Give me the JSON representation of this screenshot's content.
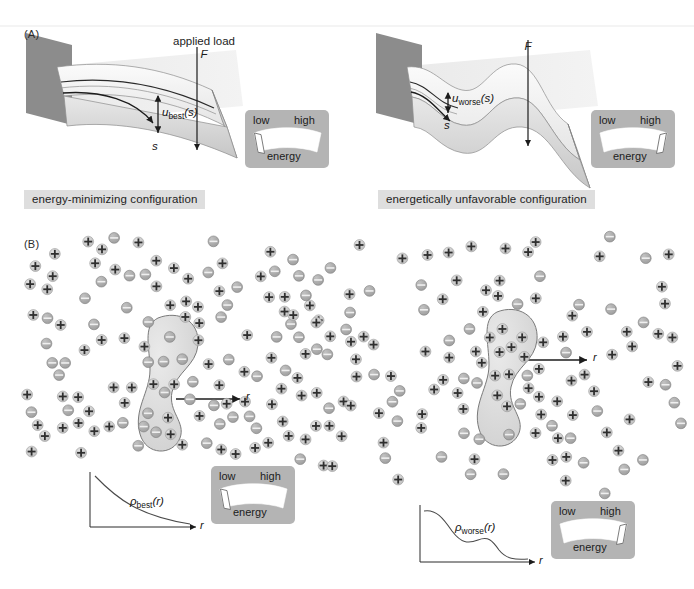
{
  "figure": {
    "width": 694,
    "height": 589,
    "background": "#ffffff"
  },
  "panels": {
    "a": {
      "letter": "(A)",
      "left": {
        "caption": "energy-minimizing configuration",
        "load_label_line1": "applied load",
        "load_label_line2": "F",
        "displacement_symbol": "u",
        "displacement_subscript": "best",
        "displacement_argument": "(s)",
        "arclength_label": "s",
        "gauge": {
          "low_label": "low",
          "high_label": "high",
          "unit_label": "energy",
          "needle_position": "low"
        }
      },
      "right": {
        "caption": "energetically unfavorable configuration",
        "load_label_line2": "F",
        "displacement_symbol": "u",
        "displacement_subscript": "worse",
        "displacement_argument": "(s)",
        "arclength_label": "s",
        "gauge": {
          "low_label": "low",
          "high_label": "high",
          "unit_label": "energy",
          "needle_position": "high"
        }
      }
    },
    "b": {
      "letter": "(B)",
      "left": {
        "radial_axis_label": "r",
        "plot": {
          "curve_symbol": "ρ",
          "curve_subscript": "best",
          "curve_argument": "(r)",
          "x_axis_label": "r"
        },
        "gauge": {
          "low_label": "low",
          "high_label": "high",
          "unit_label": "energy",
          "needle_position": "low"
        }
      },
      "right": {
        "radial_axis_label": "r",
        "plot": {
          "curve_symbol": "ρ",
          "curve_subscript": "worse",
          "curve_argument": "(r)",
          "x_axis_label": "r"
        },
        "gauge": {
          "low_label": "low",
          "high_label": "high",
          "unit_label": "energy",
          "needle_position": "high"
        }
      }
    }
  },
  "colors": {
    "wall_gray": "#8c8c8c",
    "beam_top": "#f2f2f2",
    "beam_side": "#d9d9d9",
    "plane_gray": "#e6e6e6",
    "caption_bg": "#dedede",
    "gauge_bg": "#b4b4b4",
    "gauge_band": "#ffffff",
    "ion_positive_fill": "#c9c9c9",
    "ion_negative_fill": "#a8a8a8",
    "stroke": "#3a3a3a"
  },
  "chart_data": [
    {
      "type": "line",
      "title": "ρ_best(r)",
      "xlabel": "r",
      "ylabel": "",
      "description": "monotonically decaying radial density profile",
      "x": [
        0,
        0.1,
        0.2,
        0.3,
        0.4,
        0.5,
        0.6,
        0.7,
        0.8,
        0.9,
        1.0
      ],
      "y": [
        1.0,
        0.72,
        0.52,
        0.38,
        0.28,
        0.21,
        0.16,
        0.12,
        0.09,
        0.07,
        0.05
      ],
      "grid": false,
      "legend": false
    },
    {
      "type": "line",
      "title": "ρ_worse(r)",
      "xlabel": "r",
      "ylabel": "",
      "description": "oscillatory, non-monotonic radial density profile",
      "x": [
        0,
        0.1,
        0.2,
        0.3,
        0.4,
        0.5,
        0.6,
        0.7,
        0.8,
        0.9,
        1.0
      ],
      "y": [
        0.88,
        0.86,
        0.74,
        0.52,
        0.38,
        0.35,
        0.38,
        0.34,
        0.2,
        0.1,
        0.07
      ],
      "grid": false,
      "legend": false
    }
  ],
  "ions": {
    "positive_glyph": "+",
    "negative_glyph": "−",
    "left_cloud_note": "dense shell of ions surrounding macro-ion",
    "right_cloud_note": "diffuse, irregular ion distribution"
  }
}
